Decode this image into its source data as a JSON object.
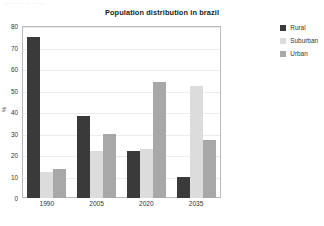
{
  "top_sliver_text": "— — — — — —",
  "chart_data": {
    "type": "bar",
    "title": "Population distribution in brazil",
    "xlabel": "",
    "ylabel": "%",
    "categories": [
      "1990",
      "2005",
      "2020",
      "2035"
    ],
    "series": [
      {
        "name": "Rural",
        "color": "#3a3a3a",
        "values": [
          75,
          38,
          22,
          10
        ]
      },
      {
        "name": "Suburban",
        "color": "#dcdcdc",
        "values": [
          12,
          22,
          23,
          52
        ]
      },
      {
        "name": "Urban",
        "color": "#a8a8a8",
        "values": [
          13.5,
          30,
          54,
          27
        ]
      }
    ],
    "ylim": [
      0,
      80
    ],
    "yticks": [
      80,
      70,
      60,
      50,
      40,
      30,
      20,
      10,
      0
    ],
    "grid": true,
    "legend_position": "top-right",
    "plot_border_color": "#b9b9b9",
    "gridline_color": "#ececec",
    "background": "#ffffff"
  }
}
